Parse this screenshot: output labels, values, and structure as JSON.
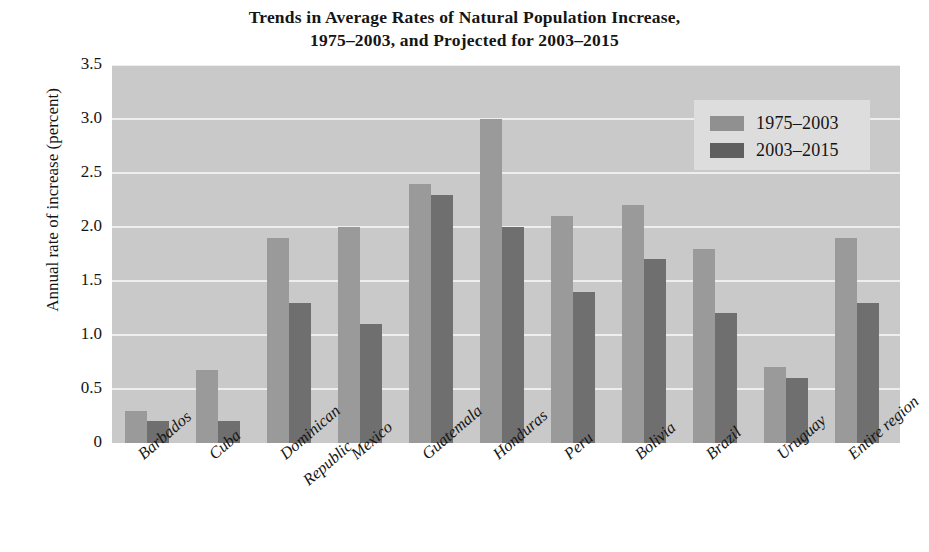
{
  "chart_data": {
    "type": "bar",
    "title": "Trends in Average Rates of Natural Population Increase, 1975–2003, and Projected for 2003–2015",
    "title_lines": [
      "Trends in Average Rates of Natural Population Increase,",
      "1975–2003, and Projected for 2003–2015"
    ],
    "xlabel": "",
    "ylabel": "Annual rate of increase (percent)",
    "ylim": [
      0,
      3.5
    ],
    "ytick_values": [
      0,
      0.5,
      1.0,
      1.5,
      2.0,
      2.5,
      3.0,
      3.5
    ],
    "ytick_labels": [
      "0",
      "0.5",
      "1.0",
      "1.5",
      "2.0",
      "2.5",
      "3.0",
      "3.5"
    ],
    "grid": true,
    "legend_position": "upper right",
    "categories": [
      "Barbados",
      "Cuba",
      "Dominican Republic",
      "Mexico",
      "Guatemala",
      "Honduras",
      "Peru",
      "Bolivia",
      "Brazil",
      "Uruguay",
      "Entire region"
    ],
    "category_label_lines": [
      [
        "Barbados"
      ],
      [
        "Cuba"
      ],
      [
        "Dominican",
        "Republic"
      ],
      [
        "Mexico"
      ],
      [
        "Guatemala"
      ],
      [
        "Honduras"
      ],
      [
        "Peru"
      ],
      [
        "Bolivia"
      ],
      [
        "Brazil"
      ],
      [
        "Uruguay"
      ],
      [
        "Entire region"
      ]
    ],
    "series": [
      {
        "name": "1975–2003",
        "color": "#9a9a9a",
        "values": [
          0.3,
          0.68,
          1.9,
          2.0,
          2.4,
          3.0,
          2.1,
          2.2,
          1.8,
          0.7,
          1.9
        ]
      },
      {
        "name": "2003–2015",
        "color": "#6f6f6f",
        "values": [
          0.2,
          0.2,
          1.3,
          1.1,
          2.3,
          2.0,
          1.4,
          1.7,
          1.2,
          0.6,
          1.3
        ]
      }
    ]
  },
  "legend": {
    "entries": [
      {
        "label": "1975–2003",
        "swatch": "light-gray-swatch"
      },
      {
        "label": "2003–2015",
        "swatch": "dark-gray-swatch"
      }
    ]
  },
  "colors": {
    "plot_background": "#c9c9c9",
    "gridline": "#eeeeee",
    "series_1975_2003": "#9a9a9a",
    "series_2003_2015": "#6f6f6f",
    "legend_background": "#dddddd",
    "page_background": "#ffffff",
    "text": "#151515"
  }
}
